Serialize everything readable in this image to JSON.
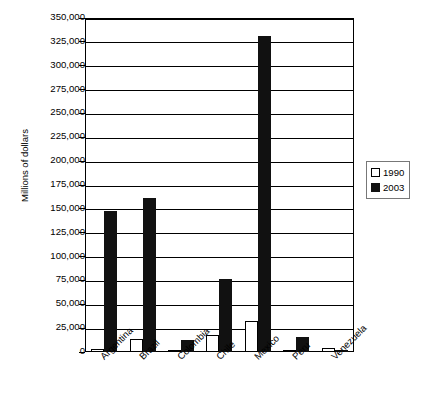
{
  "chart_data": {
    "type": "bar",
    "title": "",
    "xlabel": "",
    "ylabel": "Millions of dollars",
    "ylim": [
      0,
      350000
    ],
    "ytick_step": 25000,
    "grid": true,
    "legend_position": "right",
    "categories": [
      "Argentina",
      "Brazil",
      "Colombia",
      "Chile",
      "Mexico",
      "Peru",
      "Venezuela"
    ],
    "ytick_labels": [
      "350,000",
      "325,000",
      "300,000",
      "275,000",
      "250,000",
      "225,000",
      "200,000",
      "175,000",
      "150,000",
      "125,000",
      "100,000",
      "75,000",
      "50,000",
      "25,000",
      "0"
    ],
    "ytick_values": [
      350000,
      325000,
      300000,
      275000,
      250000,
      225000,
      200000,
      175000,
      150000,
      125000,
      100000,
      75000,
      50000,
      25000,
      0
    ],
    "series": [
      {
        "name": "1990",
        "color": "#ffffff",
        "values": [
          3000,
          14000,
          2000,
          18000,
          33000,
          2000,
          4000
        ]
      },
      {
        "name": "2003",
        "color": "#111111",
        "values": [
          148000,
          161000,
          13000,
          77000,
          331000,
          16000,
          2500
        ]
      }
    ]
  },
  "legend": {
    "items": [
      {
        "label": "1990",
        "swatch": "white"
      },
      {
        "label": "2003",
        "swatch": "black"
      }
    ]
  }
}
